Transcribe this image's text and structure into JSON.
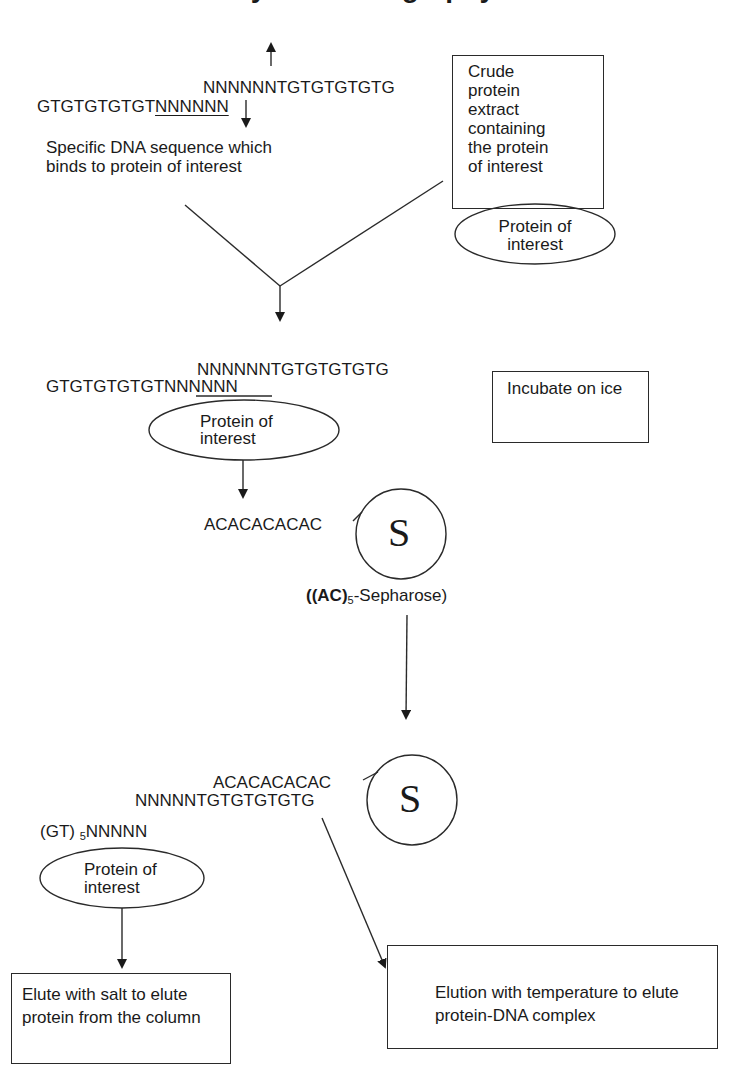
{
  "title_fragment": "Affinity chromatography",
  "step1": {
    "top_strand": "NNNNNNTGTGTGTGTG",
    "bottom_strand_prefix": "GTGTGTGTGT",
    "bottom_strand_underlined": "NNNNNN",
    "dna_label": "Specific DNA sequence which binds to protein of interest",
    "crude_box_lines": [
      "Crude",
      "protein",
      "extract",
      "containing",
      "the protein",
      "of interest"
    ],
    "protein_ellipse": "Protein of interest"
  },
  "step2": {
    "top_strand": "NNNNNNTGTGTGTGTG",
    "bottom_strand_prefix": "GTGTGTGTGT",
    "bottom_strand_underlined": "NNNNNN",
    "protein_ellipse": "Protein of interest",
    "incubate_box": "Incubate on ice"
  },
  "step3": {
    "ac_strand": "ACACACACAC",
    "bead_label": "S",
    "resin_label_pre": "((AC)",
    "resin_label_sub": "5",
    "resin_label_post": "-Sepharose)"
  },
  "step4": {
    "ac_strand": "ACACACACAC",
    "middle_strand": "NNNNNTGTGTGTGTG",
    "gt_prefix": "(GT) ",
    "gt_sub": "5",
    "gt_suffix": "NNNNN",
    "bead_label": "S",
    "protein_ellipse": "Protein of interest",
    "salt_box": "Elute with salt to elute protein from the column",
    "temp_box": "Elution with temperature to elute protein-DNA complex"
  },
  "colors": {
    "ink": "#1a1a1a",
    "background": "#ffffff"
  }
}
